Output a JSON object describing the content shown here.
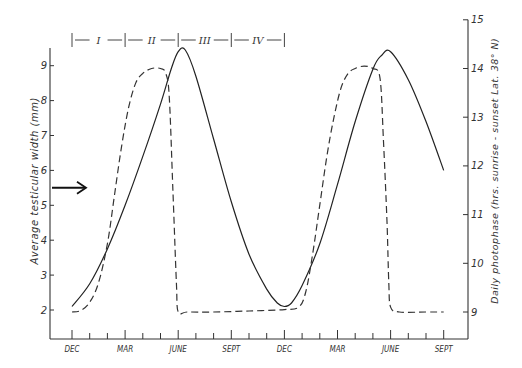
{
  "chart_data": {
    "type": "line",
    "title": "",
    "xlabel": "",
    "ylabel": "Average testicular width (mm)",
    "y2label": "Daily photophase (hrs. sunrise - sunset Lat. 38° N)",
    "x_tick_labels": [
      "DEC",
      "MAR",
      "JUNE",
      "SEPT",
      "DEC",
      "MAR",
      "JUNE",
      "SEPT"
    ],
    "x_unit": "months since first December",
    "x_range": [
      0,
      21
    ],
    "y_ticks": [
      2,
      3,
      4,
      5,
      6,
      7,
      8,
      9
    ],
    "y_range": [
      1.2,
      9.8
    ],
    "y2_ticks": [
      9,
      10,
      11,
      12,
      13,
      14,
      15
    ],
    "y2_range": [
      8.4,
      15
    ],
    "grid": false,
    "phases": [
      {
        "label": "I",
        "start": 0,
        "end": 3
      },
      {
        "label": "II",
        "start": 3,
        "end": 6
      },
      {
        "label": "III",
        "start": 6,
        "end": 9
      },
      {
        "label": "IV",
        "start": 9,
        "end": 12
      }
    ],
    "arrow_annotation": {
      "axis": "left",
      "value": 5.5
    },
    "series": [
      {
        "name": "Average testicular width (mm)",
        "style": "solid",
        "axis": "left",
        "x": [
          0,
          1,
          2,
          3,
          4,
          5,
          5.6,
          6,
          6.4,
          7,
          8,
          9,
          10,
          11,
          11.6,
          12,
          12.4,
          13,
          14,
          15,
          16,
          17,
          17.5,
          18,
          19,
          20,
          21
        ],
        "y": [
          2.1,
          2.75,
          3.75,
          5.0,
          6.4,
          7.9,
          8.9,
          9.4,
          9.45,
          8.7,
          6.9,
          5.1,
          3.6,
          2.6,
          2.2,
          2.1,
          2.2,
          2.7,
          3.9,
          5.6,
          7.4,
          8.9,
          9.3,
          9.4,
          8.6,
          7.4,
          6.0
        ]
      },
      {
        "name": "Daily photophase (hrs)",
        "style": "dashed",
        "axis": "right",
        "x": [
          0,
          0.5,
          1,
          1.5,
          2,
          2.4,
          2.8,
          3.2,
          3.6,
          4,
          4.5,
          5,
          5.3,
          5.5,
          5.7,
          5.9,
          6,
          6.5,
          8,
          10,
          12,
          12.8,
          13.2,
          13.6,
          14,
          14.4,
          14.8,
          15.2,
          15.6,
          16,
          16.5,
          17,
          17.4,
          17.6,
          17.8,
          17.9,
          18,
          18.5,
          20,
          21
        ],
        "y": [
          9.0,
          9.03,
          9.2,
          9.6,
          10.4,
          11.4,
          12.4,
          13.2,
          13.7,
          13.9,
          14.0,
          14.0,
          13.9,
          13.4,
          11.5,
          9.6,
          9.0,
          9.0,
          9.0,
          9.02,
          9.05,
          9.1,
          9.4,
          10.2,
          11.2,
          12.2,
          13.0,
          13.6,
          13.9,
          14.0,
          14.05,
          14.0,
          13.8,
          12.5,
          10.8,
          9.6,
          9.1,
          9.0,
          9.0,
          9.0
        ]
      }
    ]
  }
}
